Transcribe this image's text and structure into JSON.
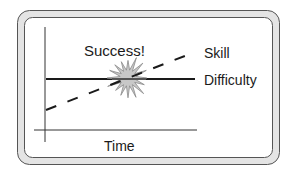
{
  "diagram": {
    "title_annotation": "Success!",
    "series": [
      {
        "name": "Skill",
        "style": "dashed",
        "trend": "increasing"
      },
      {
        "name": "Difficulty",
        "style": "solid",
        "trend": "constant"
      }
    ],
    "x_axis_label": "Time",
    "event": {
      "label": "Success!",
      "shape": "starburst",
      "meaning": "skill meets difficulty"
    }
  },
  "colors": {
    "line": "#1a1a1a",
    "frame_fill": "#e4e4e4",
    "frame_stroke": "#555555",
    "burst_fill": "#c8c8c8",
    "burst_stroke": "#8a8a8a"
  }
}
